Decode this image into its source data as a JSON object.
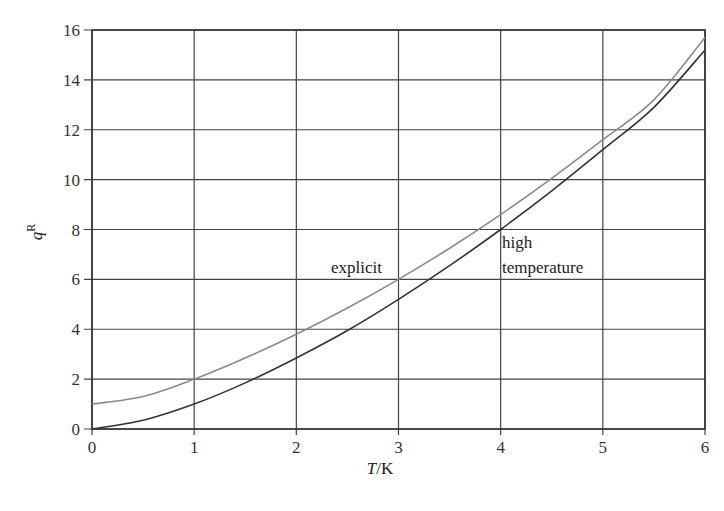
{
  "chart_data": {
    "type": "line",
    "title": "",
    "xlabel": "T/K",
    "ylabel": "q^R",
    "xlim": [
      0,
      6
    ],
    "ylim": [
      0,
      16
    ],
    "grid": true,
    "legend": "none (inline annotations)",
    "x_ticks": [
      "0",
      "1",
      "2",
      "3",
      "4",
      "5",
      "6"
    ],
    "y_ticks": [
      "0",
      "2",
      "4",
      "6",
      "8",
      "10",
      "12",
      "14",
      "16"
    ],
    "x": [
      0,
      0.5,
      1,
      1.5,
      2,
      2.5,
      3,
      3.5,
      4,
      4.5,
      5,
      5.5,
      6
    ],
    "series": [
      {
        "name": "explicit",
        "color": "#8a8a8a",
        "values": [
          1.0,
          1.3,
          2.0,
          2.85,
          3.8,
          4.85,
          6.0,
          7.25,
          8.6,
          10.05,
          11.6,
          13.2,
          15.7
        ]
      },
      {
        "name": "high temperature",
        "color": "#333333",
        "values": [
          0.0,
          0.35,
          1.0,
          1.85,
          2.85,
          3.95,
          5.2,
          6.55,
          8.0,
          9.55,
          11.2,
          12.9,
          15.2
        ]
      }
    ],
    "annotations": [
      {
        "text": "explicit",
        "x": 2.4,
        "y": 6.5
      },
      {
        "text": "high",
        "x": 4.1,
        "y": 7.8
      },
      {
        "text": "temperature",
        "x": 4.1,
        "y": 6.3
      }
    ]
  },
  "labels": {
    "xlabel_italic": "T",
    "xlabel_unit": "/K",
    "ylabel_main": "q",
    "ylabel_sup": "R",
    "explicit": "explicit",
    "high": "high",
    "temperature": "temperature"
  }
}
